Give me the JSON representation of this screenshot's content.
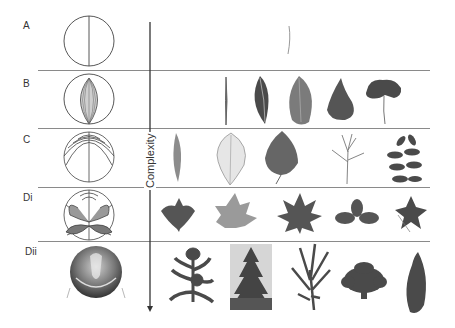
{
  "figure": {
    "axis_label": "Complexity",
    "rows": [
      {
        "label": "A",
        "description": "Single midrib, linear venation",
        "examples": [
          "thin needle-like leaf"
        ]
      },
      {
        "label": "B",
        "description": "Parallel / converging venation",
        "examples": [
          "grass blade",
          "lanceolate leaf",
          "elliptic leaf",
          "ovate leaf",
          "ginkgo leaf"
        ]
      },
      {
        "label": "C",
        "description": "Pinnate branching venation",
        "examples": [
          "narrow leaf",
          "netted veined leaf",
          "birch leaf",
          "branched shoot",
          "pinnate compound leaf"
        ]
      },
      {
        "label": "Di",
        "description": "Palmate / lobed venation",
        "examples": [
          "three-lobed leaf",
          "maple leaf",
          "palmate leaf",
          "trifoliate leaf",
          "palmately lobed leaf"
        ]
      },
      {
        "label": "Dii",
        "description": "3D shoot / whole-plant structures",
        "examples": [
          "succulent shoot",
          "conifer tree",
          "bromeliad shoot",
          "rosette flower",
          "curved pod"
        ]
      }
    ]
  }
}
